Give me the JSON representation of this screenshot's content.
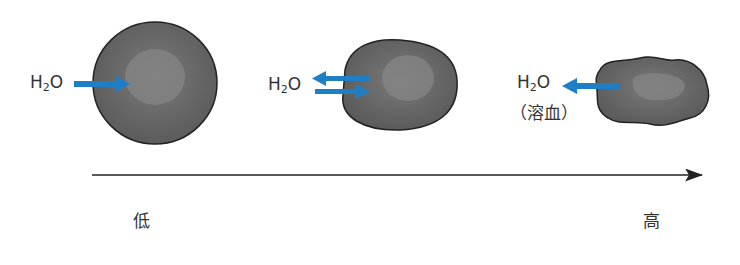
{
  "diagram": {
    "molecule": {
      "main": "H",
      "sub": "2",
      "tail": "O"
    },
    "cells": [
      {
        "id": "normal",
        "flow": "into-cell"
      },
      {
        "id": "equilibrium",
        "flow": "bidirectional"
      },
      {
        "id": "crenated",
        "flow": "out-of-cell",
        "note": "（溶血）"
      }
    ],
    "axis": {
      "low_label": "低",
      "high_label": "高"
    },
    "colors": {
      "arrow": "#1f7fc6",
      "cell_fill": "#6b6b6b",
      "nucleus": "#858585",
      "outline": "#222222",
      "axis": "#222222"
    }
  }
}
